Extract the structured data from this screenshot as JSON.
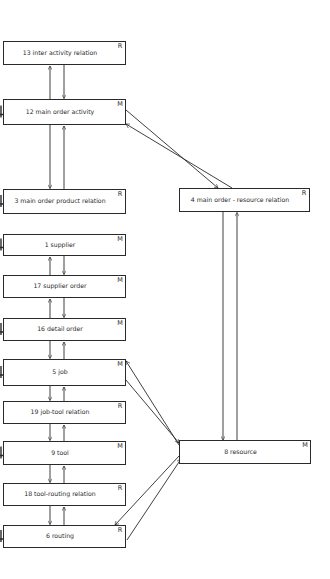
{
  "diagram": {
    "type": "entity-relationship / data structure diagram",
    "boxes": [
      {
        "id": "13",
        "label": "13   inter activity relation",
        "tag": "R",
        "x": 3,
        "y": 41,
        "w": 122,
        "h": 23,
        "mark": false
      },
      {
        "id": "12",
        "label": "12   main order activity",
        "tag": "M",
        "x": 3,
        "y": 99,
        "w": 122,
        "h": 25,
        "mark": true
      },
      {
        "id": "3",
        "label": "3   main order product relation",
        "tag": "R",
        "x": 3,
        "y": 189,
        "w": 122,
        "h": 24,
        "mark": true
      },
      {
        "id": "1",
        "label": "1   supplier",
        "tag": "M",
        "x": 3,
        "y": 234,
        "w": 122,
        "h": 21,
        "mark": true
      },
      {
        "id": "17",
        "label": "17   supplier order",
        "tag": "M",
        "x": 3,
        "y": 275,
        "w": 122,
        "h": 22,
        "mark": false
      },
      {
        "id": "16",
        "label": "16   detail order",
        "tag": "M",
        "x": 3,
        "y": 318,
        "w": 122,
        "h": 22,
        "mark": true
      },
      {
        "id": "5",
        "label": "5   job",
        "tag": "M",
        "x": 3,
        "y": 359,
        "w": 122,
        "h": 26,
        "mark": true
      },
      {
        "id": "19",
        "label": "19   job-tool relation",
        "tag": "R",
        "x": 3,
        "y": 401,
        "w": 122,
        "h": 22,
        "mark": false
      },
      {
        "id": "9",
        "label": "9   tool",
        "tag": "M",
        "x": 3,
        "y": 441,
        "w": 122,
        "h": 23,
        "mark": true
      },
      {
        "id": "18",
        "label": "18   tool-routing relation",
        "tag": "R",
        "x": 3,
        "y": 483,
        "w": 122,
        "h": 22,
        "mark": false
      },
      {
        "id": "6",
        "label": "6   routing",
        "tag": "R",
        "x": 3,
        "y": 525,
        "w": 122,
        "h": 22,
        "mark": true
      },
      {
        "id": "4",
        "label": "4   main order - resource relation",
        "tag": "R",
        "x": 179,
        "y": 188,
        "w": 130,
        "h": 23,
        "mark": false
      },
      {
        "id": "8",
        "label": "8   resource",
        "tag": "M",
        "x": 179,
        "y": 440,
        "w": 131,
        "h": 23,
        "mark": false
      }
    ],
    "connections": [
      {
        "from": "12",
        "to": "13",
        "direction": "bidirectional"
      },
      {
        "from": "12",
        "to": "3",
        "direction": "bidirectional"
      },
      {
        "from": "12",
        "to": "4",
        "direction": "bidirectional"
      },
      {
        "from": "1",
        "to": "17",
        "direction": "bidirectional"
      },
      {
        "from": "17",
        "to": "16",
        "direction": "bidirectional"
      },
      {
        "from": "16",
        "to": "5",
        "direction": "bidirectional"
      },
      {
        "from": "5",
        "to": "19",
        "direction": "bidirectional"
      },
      {
        "from": "19",
        "to": "9",
        "direction": "bidirectional"
      },
      {
        "from": "9",
        "to": "18",
        "direction": "bidirectional"
      },
      {
        "from": "18",
        "to": "6",
        "direction": "bidirectional"
      },
      {
        "from": "4",
        "to": "8",
        "direction": "bidirectional"
      },
      {
        "from": "5",
        "to": "8",
        "direction": "bidirectional"
      },
      {
        "from": "6",
        "to": "8",
        "direction": "bidirectional"
      }
    ],
    "legend_tags": {
      "M": "master entity",
      "R": "relation"
    }
  }
}
